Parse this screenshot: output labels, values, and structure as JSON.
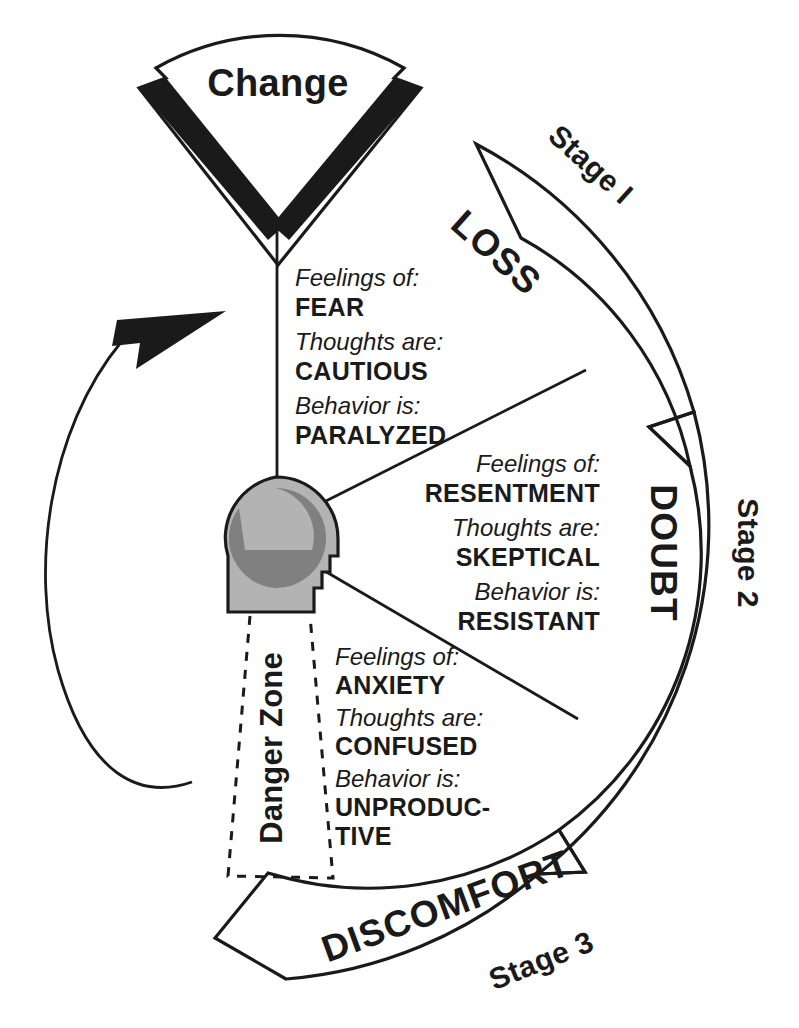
{
  "diagram": {
    "center_icon": "head-profile-icon",
    "colors": {
      "ink": "#1a1a1a",
      "head_outer": "#b3b3b3",
      "head_inner": "#808080",
      "background": "#ffffff"
    }
  },
  "change_wedge": {
    "label": "Change"
  },
  "bands": [
    {
      "name": "loss",
      "label": "LOSS",
      "stage": "Stage I"
    },
    {
      "name": "doubt",
      "label": "DOUBT",
      "stage": "Stage 2"
    },
    {
      "name": "discomfort",
      "label": "DISCOMFORT",
      "stage": "Stage 3"
    }
  ],
  "danger_zone": {
    "label": "Danger Zone"
  },
  "segments": [
    {
      "name": "loss-segment",
      "rows": [
        {
          "label": "Feelings of:",
          "value": "FEAR"
        },
        {
          "label": "Thoughts are:",
          "value": "CAUTIOUS"
        },
        {
          "label": "Behavior is:",
          "value": "PARALYZED"
        }
      ]
    },
    {
      "name": "doubt-segment",
      "rows": [
        {
          "label": "Feelings of:",
          "value": "RESENTMENT"
        },
        {
          "label": "Thoughts are:",
          "value": "SKEPTICAL"
        },
        {
          "label": "Behavior is:",
          "value": "RESISTANT"
        }
      ]
    },
    {
      "name": "discomfort-segment",
      "rows": [
        {
          "label": "Feelings of:",
          "value": "ANXIETY"
        },
        {
          "label": "Thoughts are:",
          "value": "CONFUSED"
        },
        {
          "label": "Behavior is:",
          "value": "UNPRODUC-"
        },
        {
          "label": "",
          "value": "TIVE"
        }
      ]
    }
  ],
  "cycle_arrow": {
    "name": "cycle-arrow",
    "direction": "counterclockwise"
  }
}
